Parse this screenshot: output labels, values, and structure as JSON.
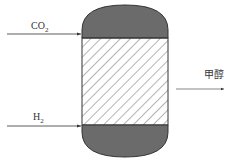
{
  "diagram": {
    "inputs": [
      {
        "name": "CO2",
        "formula_main": "CO",
        "formula_sub": "2"
      },
      {
        "name": "H2",
        "formula_main": "H",
        "formula_sub": "2"
      }
    ],
    "output": {
      "label": "甲醇"
    },
    "vessel": {
      "top_section_color": "#6b6b6b",
      "middle_section": "hatched catalyst bed",
      "bottom_section_color": "#6b6b6b"
    }
  }
}
